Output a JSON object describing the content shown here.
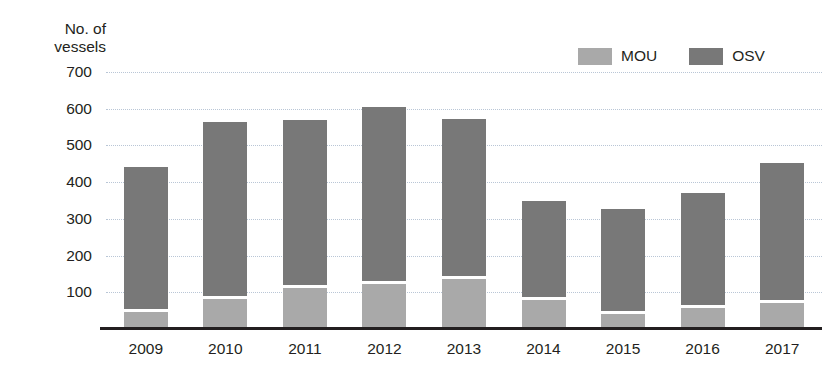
{
  "chart_data": {
    "type": "bar",
    "subtype": "stacked-vertical",
    "title": "",
    "xlabel": "",
    "ylabel": "No. of\nvessels",
    "ylim": [
      0,
      700
    ],
    "ytick_values": [
      700,
      600,
      500,
      400,
      300,
      200,
      100
    ],
    "grid": true,
    "grid_style": "dotted-horizontal",
    "legend_position": "top-right",
    "categories": [
      "2009",
      "2010",
      "2011",
      "2012",
      "2013",
      "2014",
      "2015",
      "2016",
      "2017"
    ],
    "series": [
      {
        "name": "MOU",
        "color": "#a9a9a9",
        "values": [
          55,
          90,
          120,
          130,
          145,
          88,
          50,
          65,
          78
        ]
      },
      {
        "name": "OSV",
        "color": "#787878",
        "values": [
          385,
          475,
          448,
          475,
          428,
          260,
          277,
          305,
          374
        ]
      }
    ],
    "totals": [
      440,
      565,
      568,
      605,
      573,
      348,
      327,
      370,
      452
    ]
  },
  "axis": {
    "y_title": "No. of\nvessels",
    "ticks": [
      "700",
      "600",
      "500",
      "400",
      "300",
      "200",
      "100"
    ]
  },
  "legend": {
    "items": [
      {
        "label": "MOU",
        "color": "#a9a9a9"
      },
      {
        "label": "OSV",
        "color": "#787878"
      }
    ]
  },
  "colors": {
    "mou": "#a9a9a9",
    "osv": "#787878",
    "gridline": "#b9c6d6",
    "axis": "#231f20",
    "background": "#ffffff"
  }
}
